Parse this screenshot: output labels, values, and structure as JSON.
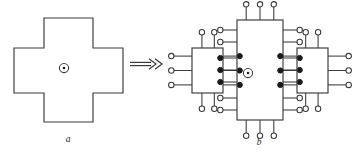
{
  "figure": {
    "background_color": "#ffffff",
    "line_color": "#3a3a3a",
    "fill_color": "#ffffff",
    "filled_node_color": "#1a1a1a",
    "width": 359,
    "height": 154
  },
  "panel_a": {
    "caption": "a",
    "caption_x": 68,
    "caption_y": 142,
    "shape_name": "cross-polygon",
    "outline_points": "44,18 93,18 93,48 123,48 123,93 93,93 93,122 44,122 44,93 14,93 14,48 44,48",
    "center_marker": {
      "name": "reference-point",
      "cx": 64,
      "cy": 68,
      "ring_r": 4.6,
      "dot_r": 1.25
    }
  },
  "transform_arrow": {
    "name": "double-right-arrow",
    "glyph": "double-arrow",
    "x1": 130,
    "x2": 158,
    "y": 64,
    "gap": 3.2,
    "head_len": 7,
    "head_spread": 5.2
  },
  "panel_b": {
    "caption": "b",
    "caption_x": 259,
    "caption_y": 145,
    "blocks": [
      {
        "name": "left-substructure",
        "x": 192,
        "y": 48,
        "w": 31,
        "h": 45,
        "terminals": {
          "top": {
            "count": 2,
            "type": "open",
            "lead": 13,
            "offsets": [
              0.32,
              0.72
            ]
          },
          "bottom": {
            "count": 2,
            "type": "open",
            "lead": 13,
            "offsets": [
              0.32,
              0.72
            ]
          },
          "left": {
            "count": 3,
            "type": "open",
            "lead": 18,
            "offsets": [
              0.18,
              0.5,
              0.82
            ]
          },
          "right": {
            "count": 3,
            "type": "filled",
            "lead": 14,
            "offsets": [
              0.18,
              0.5,
              0.82
            ]
          }
        }
      },
      {
        "name": "central-substructure",
        "x": 237,
        "y": 20,
        "w": 46,
        "h": 100,
        "center_marker": {
          "name": "reference-point",
          "cx": 248,
          "cy": 73,
          "ring_r": 4.6,
          "dot_r": 1.25
        },
        "terminals": {
          "top": {
            "count": 3,
            "type": "open",
            "lead": 13,
            "offsets": [
              0.2,
              0.5,
              0.8
            ]
          },
          "bottom": {
            "count": 3,
            "type": "open",
            "lead": 13,
            "offsets": [
              0.2,
              0.5,
              0.8
            ]
          },
          "left": {
            "count": 7,
            "type": "mixed",
            "lead": 14,
            "offsets": [
              0.1,
              0.22,
              0.38,
              0.5,
              0.62,
              0.78,
              0.9
            ],
            "types": [
              "open",
              "open",
              "filled",
              "filled",
              "filled",
              "open",
              "open"
            ]
          },
          "right": {
            "count": 7,
            "type": "mixed",
            "lead": 14,
            "offsets": [
              0.1,
              0.22,
              0.38,
              0.5,
              0.62,
              0.78,
              0.9
            ],
            "types": [
              "open",
              "open",
              "filled",
              "filled",
              "filled",
              "open",
              "open"
            ]
          }
        }
      },
      {
        "name": "right-substructure",
        "x": 297,
        "y": 48,
        "w": 31,
        "h": 45,
        "terminals": {
          "top": {
            "count": 2,
            "type": "open",
            "lead": 13,
            "offsets": [
              0.28,
              0.68
            ]
          },
          "bottom": {
            "count": 2,
            "type": "open",
            "lead": 13,
            "offsets": [
              0.28,
              0.68
            ]
          },
          "left": {
            "count": 3,
            "type": "filled",
            "lead": 14,
            "offsets": [
              0.18,
              0.5,
              0.82
            ]
          },
          "right": {
            "count": 3,
            "type": "open",
            "lead": 18,
            "offsets": [
              0.18,
              0.5,
              0.82
            ]
          }
        }
      }
    ],
    "terminal_radius_open": 2.7,
    "terminal_radius_filled": 2.6
  }
}
